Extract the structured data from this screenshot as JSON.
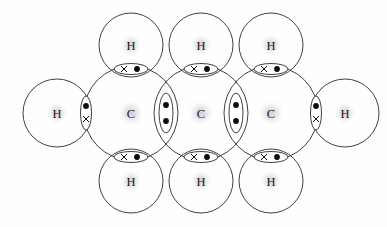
{
  "diagram": {
    "kind": "lewis-dot-and-cross-structure",
    "molecule_label": "propane-skeleton",
    "colors": {
      "background": "#fefefe",
      "stroke": "#2b2b2b",
      "electron": "#0b0b0b",
      "label": "#1a1a1a",
      "halo": "#cfcfcf"
    },
    "geometry": {
      "carbon_radius": 47,
      "hydrogen_radius": 32,
      "terminal_hydrogen_radius": 34,
      "row_center_y": 113,
      "top_row_y": 45,
      "bottom_row_y": 181
    },
    "atoms": [
      {
        "id": "C1",
        "symbol": "C",
        "cx": 131,
        "cy": 113,
        "r": 47,
        "kind": "carbon"
      },
      {
        "id": "C2",
        "symbol": "C",
        "cx": 201,
        "cy": 113,
        "r": 47,
        "kind": "carbon"
      },
      {
        "id": "C3",
        "symbol": "C",
        "cx": 271,
        "cy": 113,
        "r": 47,
        "kind": "carbon"
      },
      {
        "id": "H1",
        "symbol": "H",
        "cx": 131,
        "cy": 45,
        "r": 32,
        "kind": "hydrogen"
      },
      {
        "id": "H2",
        "symbol": "H",
        "cx": 201,
        "cy": 45,
        "r": 32,
        "kind": "hydrogen"
      },
      {
        "id": "H3",
        "symbol": "H",
        "cx": 271,
        "cy": 45,
        "r": 32,
        "kind": "hydrogen"
      },
      {
        "id": "H4",
        "symbol": "H",
        "cx": 131,
        "cy": 181,
        "r": 32,
        "kind": "hydrogen"
      },
      {
        "id": "H5",
        "symbol": "H",
        "cx": 201,
        "cy": 181,
        "r": 32,
        "kind": "hydrogen"
      },
      {
        "id": "H6",
        "symbol": "H",
        "cx": 271,
        "cy": 181,
        "r": 32,
        "kind": "hydrogen"
      },
      {
        "id": "H7",
        "symbol": "H",
        "cx": 57,
        "cy": 113,
        "r": 34,
        "kind": "hydrogen"
      },
      {
        "id": "H8",
        "symbol": "H",
        "cx": 345,
        "cy": 113,
        "r": 34,
        "kind": "hydrogen"
      }
    ],
    "bonds": [
      {
        "id": "b-C1-H1",
        "between": [
          "C1",
          "H1"
        ],
        "cx": 131,
        "cy": 69,
        "orientation": "horizontal",
        "rx": 17,
        "ry": 5.5,
        "electrons": [
          {
            "type": "cross",
            "x": 124,
            "y": 69
          },
          {
            "type": "dot",
            "x": 137,
            "y": 69
          }
        ]
      },
      {
        "id": "b-C2-H2",
        "between": [
          "C2",
          "H2"
        ],
        "cx": 201,
        "cy": 69,
        "orientation": "horizontal",
        "rx": 17,
        "ry": 5.5,
        "electrons": [
          {
            "type": "cross",
            "x": 194,
            "y": 69
          },
          {
            "type": "dot",
            "x": 207,
            "y": 69
          }
        ]
      },
      {
        "id": "b-C3-H3",
        "between": [
          "C3",
          "H3"
        ],
        "cx": 271,
        "cy": 69,
        "orientation": "horizontal",
        "rx": 17,
        "ry": 5.5,
        "electrons": [
          {
            "type": "cross",
            "x": 264,
            "y": 69
          },
          {
            "type": "dot",
            "x": 277,
            "y": 69
          }
        ]
      },
      {
        "id": "b-C1-H4",
        "between": [
          "C1",
          "H4"
        ],
        "cx": 131,
        "cy": 157,
        "orientation": "horizontal",
        "rx": 17,
        "ry": 5.5,
        "electrons": [
          {
            "type": "cross",
            "x": 124,
            "y": 157
          },
          {
            "type": "dot",
            "x": 137,
            "y": 157
          }
        ]
      },
      {
        "id": "b-C2-H5",
        "between": [
          "C2",
          "H5"
        ],
        "cx": 201,
        "cy": 157,
        "orientation": "horizontal",
        "rx": 17,
        "ry": 5.5,
        "electrons": [
          {
            "type": "cross",
            "x": 194,
            "y": 157
          },
          {
            "type": "dot",
            "x": 207,
            "y": 157
          }
        ]
      },
      {
        "id": "b-C3-H6",
        "between": [
          "C3",
          "H6"
        ],
        "cx": 271,
        "cy": 157,
        "orientation": "horizontal",
        "rx": 17,
        "ry": 5.5,
        "electrons": [
          {
            "type": "cross",
            "x": 264,
            "y": 157
          },
          {
            "type": "dot",
            "x": 277,
            "y": 157
          }
        ]
      },
      {
        "id": "b-H7-C1",
        "between": [
          "H7",
          "C1"
        ],
        "cx": 86,
        "cy": 113,
        "orientation": "vertical",
        "rx": 5.5,
        "ry": 17,
        "electrons": [
          {
            "type": "dot",
            "x": 86,
            "y": 106
          },
          {
            "type": "cross",
            "x": 86,
            "y": 119
          }
        ]
      },
      {
        "id": "b-C3-H8",
        "between": [
          "C3",
          "H8"
        ],
        "cx": 316,
        "cy": 113,
        "orientation": "vertical",
        "rx": 5.5,
        "ry": 17,
        "electrons": [
          {
            "type": "dot",
            "x": 316,
            "y": 106
          },
          {
            "type": "cross",
            "x": 316,
            "y": 119
          }
        ]
      },
      {
        "id": "b-C1-C2",
        "between": [
          "C1",
          "C2"
        ],
        "cx": 166,
        "cy": 113,
        "orientation": "vertical",
        "rx": 7,
        "ry": 20,
        "electrons": [
          {
            "type": "dot",
            "x": 166,
            "y": 105
          },
          {
            "type": "dot",
            "x": 166,
            "y": 121
          }
        ]
      },
      {
        "id": "b-C2-C3",
        "between": [
          "C2",
          "C3"
        ],
        "cx": 236,
        "cy": 113,
        "orientation": "vertical",
        "rx": 7,
        "ry": 20,
        "electrons": [
          {
            "type": "dot",
            "x": 236,
            "y": 105
          },
          {
            "type": "dot",
            "x": 236,
            "y": 121
          }
        ]
      }
    ]
  }
}
